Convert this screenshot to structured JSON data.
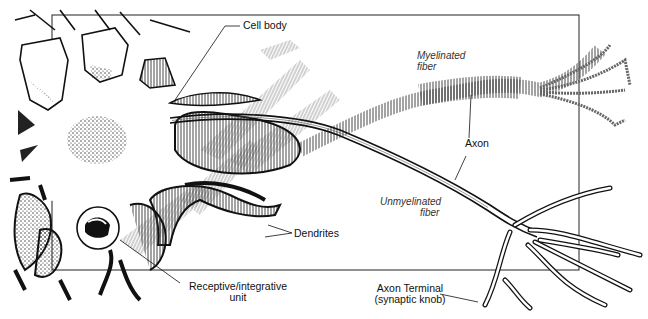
{
  "diagram": {
    "colors": {
      "ink": "#111111",
      "hatch": "#555555",
      "background": "#ffffff"
    },
    "labels": {
      "cell_body": "Cell body",
      "myelinated_1": "Myelinated",
      "myelinated_2": "fiber",
      "axon": "Axon",
      "unmyelinated_1": "Unmyelinated",
      "unmyelinated_2": "fiber",
      "dendrites": "Dendrites",
      "receptive_1": "Receptive/integrative",
      "receptive_2": "unit",
      "terminal_1": "Axon Terminal",
      "terminal_2": "(synaptic knob)"
    }
  }
}
